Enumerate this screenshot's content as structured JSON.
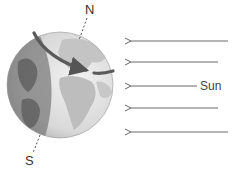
{
  "diagram": {
    "labels": {
      "north": "N",
      "south": "S",
      "sun": "Sun"
    },
    "colors": {
      "arrow": "#666666",
      "rotation_arrow": "#555555",
      "globe_day": "#e6e6e6",
      "globe_night": "#8a8a8a",
      "land_day": "#bdbdbd",
      "land_night": "#6e6e6e",
      "axis": "#555555"
    },
    "sun_rays": [
      {
        "y": 41,
        "x_start": 228,
        "x_end": 131
      },
      {
        "y": 62,
        "x_start": 218,
        "x_end": 131
      },
      {
        "y": 86,
        "x_start": 197,
        "x_end": 131
      },
      {
        "y": 108,
        "x_start": 218,
        "x_end": 131
      },
      {
        "y": 132,
        "x_start": 228,
        "x_end": 131
      }
    ]
  }
}
